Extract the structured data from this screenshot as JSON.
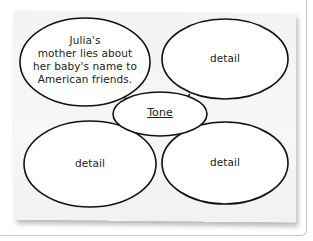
{
  "diagram": {
    "type": "web organizer",
    "center": {
      "label": "Tone"
    },
    "nodes": [
      {
        "position": "top-left",
        "text_lines": [
          "Julia's",
          "mother lies about",
          "her baby's name to",
          "American friends."
        ]
      },
      {
        "position": "top-right",
        "label": "detail"
      },
      {
        "position": "bottom-left",
        "label": "detail"
      },
      {
        "position": "bottom-right",
        "label": "detail"
      }
    ],
    "colors": {
      "stroke": "#111111",
      "fill": "#ffffff",
      "paper": "#f4f4f4",
      "text": "#222222"
    }
  }
}
